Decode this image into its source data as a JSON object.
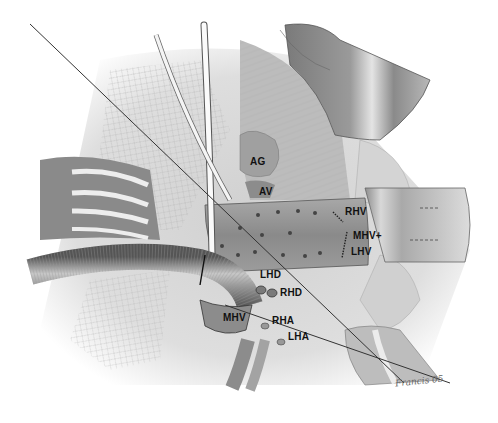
{
  "figure": {
    "labels": [
      {
        "id": "ag",
        "text": "AG",
        "x": 250,
        "y": 157
      },
      {
        "id": "av",
        "text": "AV",
        "x": 259,
        "y": 187
      },
      {
        "id": "rhv",
        "text": "RHV",
        "x": 345,
        "y": 207
      },
      {
        "id": "mhv-lhv-1",
        "text": "MHV+",
        "x": 353,
        "y": 231
      },
      {
        "id": "mhv-lhv-2",
        "text": "LHV",
        "x": 351,
        "y": 247
      },
      {
        "id": "lhd",
        "text": "LHD",
        "x": 260,
        "y": 270
      },
      {
        "id": "rhd",
        "text": "RHD",
        "x": 280,
        "y": 288
      },
      {
        "id": "mhv",
        "text": "MHV",
        "x": 223,
        "y": 313
      },
      {
        "id": "rha",
        "text": "RHA",
        "x": 272,
        "y": 316
      },
      {
        "id": "lha",
        "text": "LHA",
        "x": 288,
        "y": 332
      }
    ],
    "signature": "Francis 05"
  }
}
